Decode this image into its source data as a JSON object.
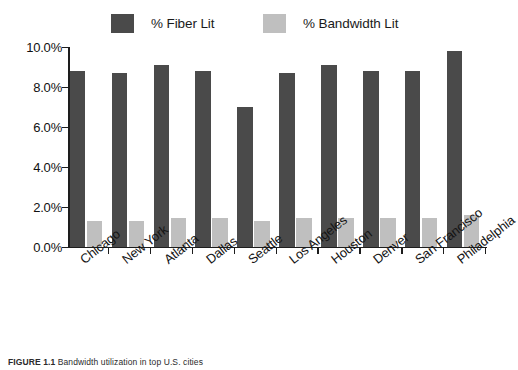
{
  "chart_data": {
    "type": "bar",
    "title": "",
    "xlabel": "",
    "ylabel": "",
    "ylim": [
      0,
      10
    ],
    "ytick_labels": [
      "10.0%",
      "8.0%",
      "6.0%",
      "4.0%",
      "2.0%",
      "0.0%"
    ],
    "ytick_values": [
      10,
      8,
      6,
      4,
      2,
      0
    ],
    "grid": false,
    "legend_position": "top",
    "categories": [
      "Chicago",
      "New York",
      "Atlanta",
      "Dallas",
      "Seattle",
      "Los Angeles",
      "Houston",
      "Denver",
      "San Francisco",
      "Philadelphia"
    ],
    "series": [
      {
        "name": "% Fiber Lit",
        "color": "#4a4a4a",
        "values": [
          8.8,
          8.7,
          9.1,
          8.8,
          7.0,
          8.7,
          9.1,
          8.8,
          8.8,
          9.8
        ]
      },
      {
        "name": "% Bandwidth Lit",
        "color": "#bfbfbf",
        "values": [
          1.3,
          1.3,
          1.45,
          1.45,
          1.3,
          1.45,
          1.45,
          1.45,
          1.45,
          1.6
        ]
      }
    ]
  },
  "caption": {
    "number": "FIGURE 1.1",
    "text": "Bandwidth utilization in top U.S. cities"
  }
}
